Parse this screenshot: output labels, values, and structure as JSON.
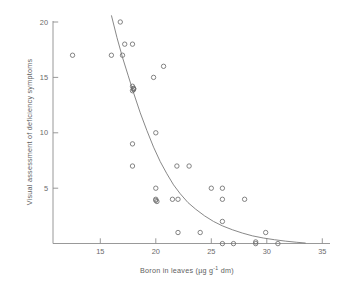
{
  "figure": {
    "title": "",
    "background_color": "#ffffff",
    "marker_color": "#6e6e6e",
    "axis_color": "#8d8d8d",
    "curve_color": "#7a7a7a"
  },
  "axis_labels": {
    "x_main": "Boron in leaves (µg g",
    "x_sup": "-1",
    "x_tail": " dm)",
    "y": "Visual assessment of deficiency symptoms"
  },
  "chart_data": {
    "type": "scatter",
    "title": "",
    "xlabel": "Boron in leaves (µg g-1 dm)",
    "ylabel": "Visual assessment of deficiency symptoms",
    "xlim": [
      11.5,
      36.5
    ],
    "ylim": [
      0,
      20.6
    ],
    "xticks": [
      15,
      20,
      25,
      30,
      35
    ],
    "yticks": [
      5,
      10,
      15,
      20
    ],
    "xtick_labels": [
      "15",
      "20",
      "25",
      "30",
      "35"
    ],
    "ytick_labels": [
      "5",
      "10",
      "15",
      "20"
    ],
    "grid": false,
    "legend": "none",
    "x": [
      12.5,
      16.0,
      16.8,
      17.0,
      17.2,
      17.9,
      18.0,
      17.9,
      17.9,
      18.0,
      18.0,
      19.8,
      20.7,
      20.0,
      17.9,
      17.9,
      20.0,
      21.9,
      23.0,
      20.0,
      25.0,
      26.0,
      26.0,
      28.0,
      20.0,
      20.1,
      21.5,
      22.0,
      26.0,
      22.0,
      24.0,
      29.9,
      26.0,
      27.0,
      29.0,
      29.0,
      31.0
    ],
    "y": [
      17,
      17,
      20,
      17,
      18,
      18,
      14,
      13.8,
      14.2,
      14.0,
      13.9,
      15,
      16,
      10,
      9,
      7,
      5,
      7,
      7,
      4.0,
      5,
      5,
      4,
      4,
      3.9,
      3.8,
      4,
      4,
      2,
      1,
      1,
      1,
      0,
      0,
      0,
      0.15,
      0
    ],
    "series": [
      {
        "name": "observations",
        "marker": "open-circle",
        "points": [
          [
            12.5,
            17
          ],
          [
            16.0,
            17
          ],
          [
            16.8,
            20
          ],
          [
            17.0,
            17
          ],
          [
            17.2,
            18
          ],
          [
            17.9,
            18
          ],
          [
            18.0,
            14
          ],
          [
            17.9,
            13.8
          ],
          [
            17.9,
            14.2
          ],
          [
            18.0,
            14.0
          ],
          [
            18.0,
            13.9
          ],
          [
            19.8,
            15
          ],
          [
            20.7,
            16
          ],
          [
            20.0,
            10
          ],
          [
            17.9,
            9
          ],
          [
            17.9,
            7
          ],
          [
            20.0,
            5
          ],
          [
            21.9,
            7
          ],
          [
            23.0,
            7
          ],
          [
            20.0,
            4.0
          ],
          [
            25.0,
            5
          ],
          [
            26.0,
            5
          ],
          [
            26.0,
            4
          ],
          [
            28.0,
            4
          ],
          [
            20.0,
            3.9
          ],
          [
            20.1,
            3.8
          ],
          [
            21.5,
            4
          ],
          [
            22.0,
            4
          ],
          [
            26.0,
            2
          ],
          [
            22.0,
            1
          ],
          [
            24.0,
            1
          ],
          [
            29.9,
            1
          ],
          [
            26.0,
            0
          ],
          [
            27.0,
            0
          ],
          [
            29.0,
            0
          ],
          [
            29.0,
            0.15
          ],
          [
            31.0,
            0
          ]
        ]
      }
    ],
    "fit_curve": {
      "description": "monotonic decreasing fitted curve",
      "points": [
        [
          16.0,
          20.6
        ],
        [
          16.5,
          18.6
        ],
        [
          17.0,
          16.8
        ],
        [
          17.5,
          15.2
        ],
        [
          18.0,
          13.6
        ],
        [
          18.6,
          11.8
        ],
        [
          19.2,
          10.2
        ],
        [
          19.8,
          8.7
        ],
        [
          20.4,
          7.4
        ],
        [
          21.0,
          6.3
        ],
        [
          21.6,
          5.3
        ],
        [
          22.2,
          4.5
        ],
        [
          22.9,
          3.7
        ],
        [
          23.6,
          3.1
        ],
        [
          24.4,
          2.5
        ],
        [
          25.2,
          2.0
        ],
        [
          26.0,
          1.6
        ],
        [
          26.9,
          1.25
        ],
        [
          27.8,
          0.95
        ],
        [
          28.7,
          0.7
        ],
        [
          29.7,
          0.5
        ],
        [
          30.7,
          0.35
        ],
        [
          31.7,
          0.22
        ],
        [
          32.7,
          0.12
        ],
        [
          33.5,
          0.05
        ]
      ]
    }
  }
}
